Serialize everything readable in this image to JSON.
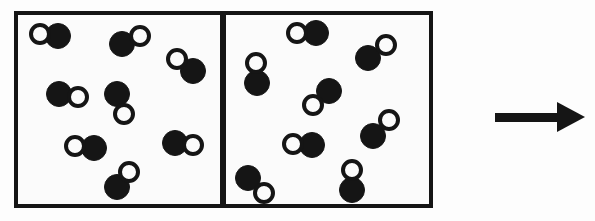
{
  "figure": {
    "background_color": "#fdfdfd",
    "stroke_color": "#151515",
    "atom_fill_color": "#151515",
    "atom_open_color": "#fbfbfb"
  },
  "boxes": [
    {
      "id": "left-container",
      "label": "Left container",
      "x": 14,
      "y": 11,
      "width": 210,
      "height": 197,
      "border_width": 4
    },
    {
      "id": "right-container",
      "label": "Right container",
      "x": 222,
      "y": 11,
      "width": 211,
      "height": 197,
      "border_width": 4
    }
  ],
  "molecules": {
    "left": [
      {
        "id": "L1",
        "open": {
          "cx": 40,
          "cy": 34,
          "r": 11
        },
        "filled": {
          "cx": 58,
          "cy": 36,
          "r": 13
        }
      },
      {
        "id": "L2",
        "open": {
          "cx": 140,
          "cy": 36,
          "r": 11
        },
        "filled": {
          "cx": 122,
          "cy": 44,
          "r": 13
        }
      },
      {
        "id": "L3",
        "open": {
          "cx": 177,
          "cy": 59,
          "r": 11
        },
        "filled": {
          "cx": 193,
          "cy": 71,
          "r": 13
        }
      },
      {
        "id": "L4",
        "open": {
          "cx": 78,
          "cy": 97,
          "r": 11
        },
        "filled": {
          "cx": 59,
          "cy": 94,
          "r": 13
        }
      },
      {
        "id": "L5",
        "open": {
          "cx": 124,
          "cy": 114,
          "r": 11
        },
        "filled": {
          "cx": 117,
          "cy": 94,
          "r": 13
        }
      },
      {
        "id": "L6",
        "open": {
          "cx": 75,
          "cy": 146,
          "r": 11
        },
        "filled": {
          "cx": 94,
          "cy": 148,
          "r": 13
        }
      },
      {
        "id": "L7",
        "open": {
          "cx": 193,
          "cy": 145,
          "r": 11
        },
        "filled": {
          "cx": 175,
          "cy": 143,
          "r": 13
        }
      },
      {
        "id": "L8",
        "open": {
          "cx": 129,
          "cy": 172,
          "r": 11
        },
        "filled": {
          "cx": 117,
          "cy": 187,
          "r": 13
        }
      }
    ],
    "right": [
      {
        "id": "R1",
        "open": {
          "cx": 297,
          "cy": 33,
          "r": 11
        },
        "filled": {
          "cx": 316,
          "cy": 33,
          "r": 13
        }
      },
      {
        "id": "R2",
        "open": {
          "cx": 256,
          "cy": 63,
          "r": 11
        },
        "filled": {
          "cx": 257,
          "cy": 83,
          "r": 13
        }
      },
      {
        "id": "R3",
        "open": {
          "cx": 386,
          "cy": 45,
          "r": 11
        },
        "filled": {
          "cx": 368,
          "cy": 58,
          "r": 13
        }
      },
      {
        "id": "R4",
        "open": {
          "cx": 313,
          "cy": 105,
          "r": 11
        },
        "filled": {
          "cx": 329,
          "cy": 91,
          "r": 13
        }
      },
      {
        "id": "R5",
        "open": {
          "cx": 389,
          "cy": 120,
          "r": 11
        },
        "filled": {
          "cx": 373,
          "cy": 136,
          "r": 13
        }
      },
      {
        "id": "R6",
        "open": {
          "cx": 293,
          "cy": 144,
          "r": 11
        },
        "filled": {
          "cx": 312,
          "cy": 145,
          "r": 13
        }
      },
      {
        "id": "R7",
        "open": {
          "cx": 352,
          "cy": 170,
          "r": 11
        },
        "filled": {
          "cx": 352,
          "cy": 190,
          "r": 13
        }
      },
      {
        "id": "R8",
        "open": {
          "cx": 264,
          "cy": 193,
          "r": 11
        },
        "filled": {
          "cx": 248,
          "cy": 178,
          "r": 13
        }
      }
    ]
  },
  "arrow": {
    "label": "reaction arrow pointing right",
    "direction": "right",
    "shaft": {
      "x": 495,
      "y": 113,
      "width": 66,
      "height": 9
    },
    "head": {
      "x": 557,
      "y": 102,
      "width": 28,
      "height": 31
    }
  },
  "counts": {
    "left_molecule_count": 8,
    "right_molecule_count": 8
  }
}
